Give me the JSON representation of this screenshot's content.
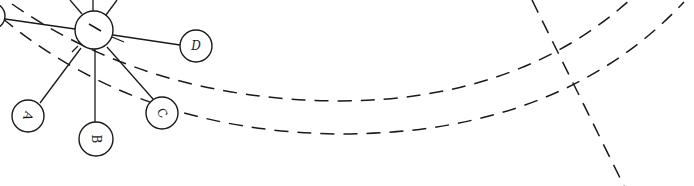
{
  "diagram": {
    "type": "network-hub-spoke",
    "colors": {
      "stroke": "#1a1a1a",
      "background": "#ffffff"
    },
    "hub": {
      "id": "hub",
      "label": "",
      "mark": "/",
      "cx": 94,
      "cy": 30,
      "r": 19
    },
    "nodes": [
      {
        "id": "A",
        "label": "A",
        "cx": 28,
        "cy": 116,
        "r": 16,
        "rotate": 110
      },
      {
        "id": "B",
        "label": "B",
        "cx": 96,
        "cy": 139,
        "r": 17,
        "rotate": 90
      },
      {
        "id": "C",
        "label": "C",
        "cx": 162,
        "cy": 113,
        "r": 16,
        "rotate": 60
      },
      {
        "id": "D",
        "label": "D",
        "cx": 196,
        "cy": 46,
        "r": 16,
        "rotate": 0
      },
      {
        "id": "left-partial",
        "label": "",
        "cx": -8,
        "cy": 16,
        "r": 13,
        "rotate": 0
      }
    ],
    "edges": [
      {
        "from": "hub",
        "to": "A"
      },
      {
        "from": "hub",
        "to": "B"
      },
      {
        "from": "hub",
        "to": "C"
      },
      {
        "from": "hub",
        "to": "D"
      },
      {
        "from": "hub",
        "to": "left-partial"
      }
    ],
    "offscreen_spokes": 3,
    "dashed_paths": [
      {
        "name": "orbit-inner",
        "d": "M 12 4 Q 150 100 340 101 Q 520 100 632 -2"
      },
      {
        "name": "orbit-outer",
        "d": "M 2 18 Q 140 132 340 134 Q 560 134 684 2"
      },
      {
        "name": "crossing-line",
        "d": "M 532 0 L 624 186"
      }
    ]
  }
}
